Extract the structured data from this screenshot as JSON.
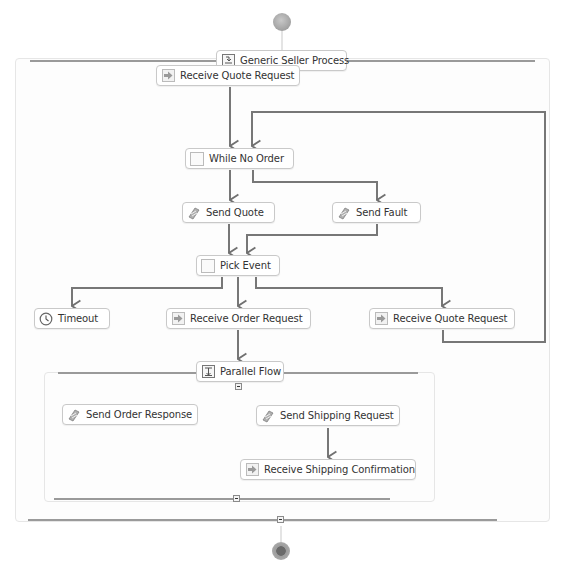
{
  "process": {
    "title": "Generic Seller Process",
    "start_icon": "start-event-icon",
    "end_icon": "end-event-icon"
  },
  "nodes": {
    "receive_quote_request_1": {
      "label": "Receive Quote Request",
      "icon": "receive-icon"
    },
    "while_no_order": {
      "label": "While No Order",
      "icon": "while-loop-icon"
    },
    "send_quote": {
      "label": "Send Quote",
      "icon": "send-icon"
    },
    "send_fault": {
      "label": "Send Fault",
      "icon": "send-icon"
    },
    "pick_event": {
      "label": "Pick Event",
      "icon": "pick-icon"
    },
    "timeout": {
      "label": "Timeout",
      "icon": "clock-icon"
    },
    "receive_order_request": {
      "label": "Receive Order Request",
      "icon": "receive-icon"
    },
    "receive_quote_request_2": {
      "label": "Receive Quote Request",
      "icon": "receive-icon"
    },
    "parallel_flow": {
      "label": "Parallel Flow",
      "icon": "parallel-flow-icon"
    },
    "send_order_response": {
      "label": "Send Order Response",
      "icon": "send-icon"
    },
    "send_shipping_request": {
      "label": "Send Shipping Request",
      "icon": "send-icon"
    },
    "receive_shipping_confirmation": {
      "label": "Receive Shipping Confirmation",
      "icon": "receive-icon"
    }
  },
  "edges": [
    [
      "start",
      "Generic Seller Process"
    ],
    [
      "Receive Quote Request",
      "While No Order"
    ],
    [
      "While No Order",
      "Send Quote"
    ],
    [
      "While No Order",
      "Send Fault"
    ],
    [
      "Send Quote",
      "Pick Event"
    ],
    [
      "Send Fault",
      "Pick Event"
    ],
    [
      "Pick Event",
      "Timeout"
    ],
    [
      "Pick Event",
      "Receive Order Request"
    ],
    [
      "Pick Event",
      "Receive Quote Request"
    ],
    [
      "Receive Quote Request",
      "While No Order"
    ],
    [
      "Receive Order Request",
      "Parallel Flow"
    ],
    [
      "Send Shipping Request",
      "Receive Shipping Confirmation"
    ],
    [
      "Generic Seller Process",
      "end"
    ]
  ],
  "colors": {
    "edge": "#707070",
    "node_border": "#c9c9c9",
    "container_line": "#9a9a9a"
  }
}
